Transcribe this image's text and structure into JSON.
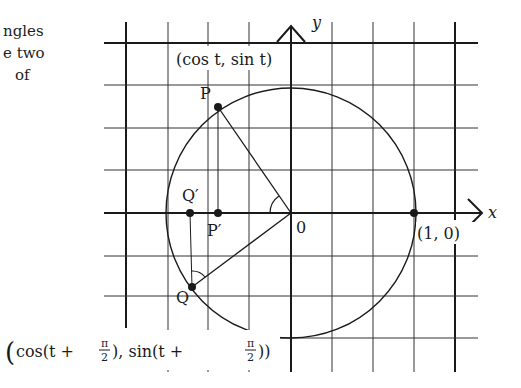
{
  "page_text": {
    "lines": [
      "ngles",
      "e two",
      "of"
    ]
  },
  "diagram": {
    "axes": {
      "x_label": "x",
      "y_label": "y",
      "origin_label": "0"
    },
    "points": {
      "P": {
        "label": "P",
        "coord_label": "(cos t, sin t)"
      },
      "P_prime": {
        "label": "P′"
      },
      "Q": {
        "label": "Q"
      },
      "Q_prime": {
        "label": "Q′"
      },
      "one_zero": {
        "label": "(1, 0)"
      }
    },
    "q_coord_label": {
      "open": "(",
      "cos_part": "cos(t + ",
      "frac_num": "π",
      "frac_den": "2",
      "mid": "), sin(t + ",
      "close": "))"
    },
    "colors": {
      "ink": "#1a1a1a",
      "grid": "#333333",
      "background": "#ffffff"
    }
  }
}
